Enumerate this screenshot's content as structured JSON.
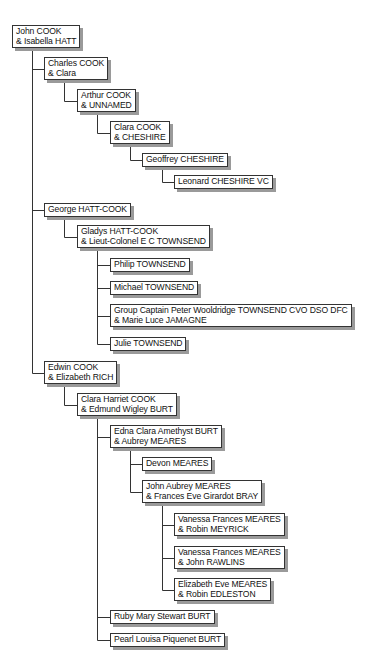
{
  "diagram": {
    "type": "family-tree",
    "line_color": "#333333",
    "shadow_color": "#9a9a9a",
    "nodes": [
      {
        "id": "n0",
        "parent": null,
        "x": 12,
        "y": 25,
        "lines": [
          "John COOK",
          "& Isabella HATT"
        ]
      },
      {
        "id": "n1",
        "parent": "n0",
        "x": 44,
        "y": 57,
        "lines": [
          "Charles COOK",
          "& Clara"
        ]
      },
      {
        "id": "n2",
        "parent": "n1",
        "x": 77,
        "y": 89,
        "lines": [
          "Arthur COOK",
          "& UNNAMED"
        ]
      },
      {
        "id": "n3",
        "parent": "n2",
        "x": 110,
        "y": 121,
        "lines": [
          "Clara COOK",
          "& CHESHIRE"
        ]
      },
      {
        "id": "n4",
        "parent": "n3",
        "x": 142,
        "y": 153,
        "lines": [
          "Geoffrey CHESHIRE"
        ]
      },
      {
        "id": "n5",
        "parent": "n4",
        "x": 174,
        "y": 175,
        "lines": [
          "Leonard CHESHIRE VC"
        ]
      },
      {
        "id": "n6",
        "parent": "n0",
        "x": 44,
        "y": 203,
        "lines": [
          "George HATT-COOK"
        ]
      },
      {
        "id": "n7",
        "parent": "n6",
        "x": 77,
        "y": 225,
        "lines": [
          "Gladys HATT-COOK",
          "& Lieut-Colonel E C TOWNSEND"
        ]
      },
      {
        "id": "n8",
        "parent": "n7",
        "x": 110,
        "y": 258,
        "lines": [
          "Philip TOWNSEND"
        ]
      },
      {
        "id": "n9",
        "parent": "n7",
        "x": 110,
        "y": 281,
        "lines": [
          "Michael TOWNSEND"
        ]
      },
      {
        "id": "n10",
        "parent": "n7",
        "x": 110,
        "y": 304,
        "lines": [
          "Group Captain Peter Wooldridge TOWNSEND CVO DSO DFC",
          "& Marie Luce JAMAGNE"
        ]
      },
      {
        "id": "n11",
        "parent": "n7",
        "x": 110,
        "y": 337,
        "lines": [
          "Julie TOWNSEND"
        ]
      },
      {
        "id": "n12",
        "parent": "n0",
        "x": 44,
        "y": 361,
        "lines": [
          "Edwin COOK",
          "& Elizabeth RICH"
        ]
      },
      {
        "id": "n13",
        "parent": "n12",
        "x": 77,
        "y": 393,
        "lines": [
          "Clara Harriet COOK",
          "& Edmund Wigley BURT"
        ]
      },
      {
        "id": "n14",
        "parent": "n13",
        "x": 110,
        "y": 425,
        "lines": [
          "Edna Clara Amethyst BURT",
          "& Aubrey MEARES"
        ]
      },
      {
        "id": "n15",
        "parent": "n14",
        "x": 142,
        "y": 457,
        "lines": [
          "Devon MEARES"
        ]
      },
      {
        "id": "n16",
        "parent": "n14",
        "x": 142,
        "y": 480,
        "lines": [
          "John Aubrey MEARES",
          "& Frances Eve Girardot BRAY"
        ]
      },
      {
        "id": "n17",
        "parent": "n16",
        "x": 174,
        "y": 513,
        "lines": [
          "Vanessa Frances MEARES",
          "& Robin MEYRICK"
        ]
      },
      {
        "id": "n18",
        "parent": "n16",
        "x": 174,
        "y": 546,
        "lines": [
          "Vanessa Frances MEARES",
          "& John RAWLINS"
        ]
      },
      {
        "id": "n19",
        "parent": "n16",
        "x": 174,
        "y": 578,
        "lines": [
          "Elizabeth Eve MEARES",
          "& Robin EDLESTON"
        ]
      },
      {
        "id": "n20",
        "parent": "n13",
        "x": 110,
        "y": 610,
        "lines": [
          "Ruby Mary Stewart BURT"
        ]
      },
      {
        "id": "n21",
        "parent": "n13",
        "x": 110,
        "y": 633,
        "lines": [
          "Pearl Louisa Piquenet BURT"
        ]
      }
    ]
  }
}
